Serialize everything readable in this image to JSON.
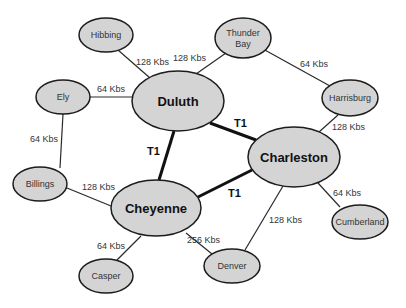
{
  "diagram": {
    "type": "network-topology",
    "nodes": [
      {
        "id": "hibbing",
        "label": "Hibbing",
        "cx": 106,
        "cy": 35,
        "rx": 27,
        "ry": 17,
        "size": "small"
      },
      {
        "id": "thunder_bay",
        "label_line1": "Thunder",
        "label_line2": "Bay",
        "cx": 243,
        "cy": 38,
        "rx": 28,
        "ry": 20,
        "size": "small"
      },
      {
        "id": "ely",
        "label": "Ely",
        "cx": 63,
        "cy": 97,
        "rx": 27,
        "ry": 17,
        "size": "small"
      },
      {
        "id": "duluth",
        "label": "Duluth",
        "cx": 178,
        "cy": 101,
        "rx": 46,
        "ry": 30,
        "size": "big"
      },
      {
        "id": "harrisburg",
        "label": "Harrisburg",
        "cx": 350,
        "cy": 98,
        "rx": 28,
        "ry": 18,
        "size": "small"
      },
      {
        "id": "charleston",
        "label": "Charleston",
        "cx": 294,
        "cy": 157,
        "rx": 46,
        "ry": 30,
        "size": "big"
      },
      {
        "id": "billings",
        "label": "Billings",
        "cx": 40,
        "cy": 184,
        "rx": 27,
        "ry": 17,
        "size": "small"
      },
      {
        "id": "cheyenne",
        "label": "Cheyenne",
        "cx": 156,
        "cy": 208,
        "rx": 45,
        "ry": 28,
        "size": "big"
      },
      {
        "id": "casper",
        "label": "Casper",
        "cx": 106,
        "cy": 276,
        "rx": 27,
        "ry": 17,
        "size": "small"
      },
      {
        "id": "denver",
        "label": "Denver",
        "cx": 232,
        "cy": 266,
        "rx": 28,
        "ry": 17,
        "size": "small"
      },
      {
        "id": "cumberland",
        "label": "Cumberland",
        "cx": 360,
        "cy": 222,
        "rx": 28,
        "ry": 17,
        "size": "small"
      }
    ],
    "edges": [
      {
        "from": "hibbing",
        "to": "duluth",
        "label": "128 Kbs",
        "x1": 118,
        "y1": 50,
        "x2": 150,
        "y2": 78,
        "lx": 136,
        "ly": 65,
        "t1": false
      },
      {
        "from": "thunder_bay",
        "to": "duluth",
        "label": "128 Kbs",
        "x1": 226,
        "y1": 53,
        "x2": 196,
        "y2": 74,
        "lx": 173,
        "ly": 61,
        "t1": false
      },
      {
        "from": "ely",
        "to": "duluth",
        "label": "64 Kbs",
        "x1": 90,
        "y1": 97,
        "x2": 132,
        "y2": 97,
        "lx": 97,
        "ly": 92,
        "t1": false
      },
      {
        "from": "thunder_bay",
        "to": "harrisburg",
        "label": "64 Kbs",
        "x1": 263,
        "y1": 49,
        "x2": 330,
        "y2": 86,
        "lx": 300,
        "ly": 67,
        "t1": false
      },
      {
        "from": "harrisburg",
        "to": "charleston",
        "label": "128 Kbs",
        "x1": 338,
        "y1": 115,
        "x2": 319,
        "y2": 132,
        "lx": 332,
        "ly": 130,
        "t1": false
      },
      {
        "from": "ely",
        "to": "billings",
        "label": "64 Kbs",
        "x1": 63,
        "y1": 114,
        "x2": 60,
        "y2": 168,
        "lx": 30,
        "ly": 142,
        "t1": false
      },
      {
        "from": "billings",
        "to": "cheyenne",
        "label": "128 Kbs",
        "x1": 67,
        "y1": 188,
        "x2": 111,
        "y2": 206,
        "lx": 82,
        "ly": 190,
        "t1": false
      },
      {
        "from": "duluth",
        "to": "charleston",
        "label": "T1",
        "x1": 210,
        "y1": 123,
        "x2": 256,
        "y2": 140,
        "lx": 234,
        "ly": 127,
        "t1": true
      },
      {
        "from": "duluth",
        "to": "cheyenne",
        "label": "T1",
        "x1": 174,
        "y1": 131,
        "x2": 159,
        "y2": 180,
        "lx": 147,
        "ly": 155,
        "t1": true
      },
      {
        "from": "cheyenne",
        "to": "charleston",
        "label": "T1",
        "x1": 198,
        "y1": 197,
        "x2": 252,
        "y2": 170,
        "lx": 228,
        "ly": 197,
        "t1": true
      },
      {
        "from": "charleston",
        "to": "cumberland",
        "label": "64 Kbs",
        "x1": 318,
        "y1": 183,
        "x2": 340,
        "y2": 207,
        "lx": 333,
        "ly": 196,
        "t1": false
      },
      {
        "from": "charleston",
        "to": "denver",
        "label": "128 Kbs",
        "x1": 283,
        "y1": 186,
        "x2": 245,
        "y2": 250,
        "lx": 269,
        "ly": 223,
        "t1": false
      },
      {
        "from": "cheyenne",
        "to": "denver",
        "label": "256 Kbs",
        "x1": 186,
        "y1": 233,
        "x2": 212,
        "y2": 254,
        "lx": 187,
        "ly": 243,
        "t1": false
      },
      {
        "from": "cheyenne",
        "to": "casper",
        "label": "64 Kbs",
        "x1": 141,
        "y1": 236,
        "x2": 117,
        "y2": 260,
        "lx": 97,
        "ly": 249,
        "t1": false
      }
    ]
  }
}
